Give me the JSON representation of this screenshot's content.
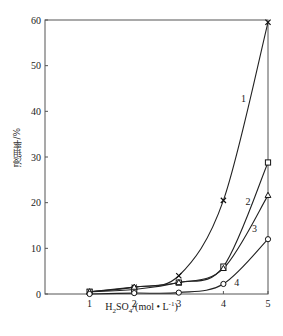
{
  "chart_data": {
    "type": "line",
    "title": "",
    "xlabel": "H2SO4/(mol·L⁻¹)",
    "ylabel": "浸钼率/%",
    "xlim": [
      0,
      5
    ],
    "ylim": [
      0,
      60
    ],
    "xticks": [
      1,
      2,
      3,
      4,
      5
    ],
    "yticks": [
      0,
      10,
      20,
      30,
      40,
      50,
      60
    ],
    "grid": false,
    "legend": "inline curve numbers",
    "x": [
      1,
      2,
      3,
      4,
      5
    ],
    "series": [
      {
        "name": "1",
        "marker": "x",
        "values": [
          0.5,
          1.5,
          4.0,
          20.5,
          59.5
        ]
      },
      {
        "name": "2",
        "marker": "square",
        "values": [
          0.5,
          1.0,
          2.5,
          6.0,
          28.8
        ]
      },
      {
        "name": "3",
        "marker": "triangle",
        "values": [
          0.5,
          1.5,
          2.5,
          5.6,
          21.6
        ]
      },
      {
        "name": "4",
        "marker": "circle",
        "values": [
          0.0,
          0.2,
          0.3,
          2.2,
          12.0
        ]
      }
    ],
    "annotations": [
      {
        "text": "1",
        "x": 4.45,
        "y": 42
      },
      {
        "text": "2",
        "x": 4.55,
        "y": 19.5
      },
      {
        "text": "3",
        "x": 4.7,
        "y": 13.5
      },
      {
        "text": "4",
        "x": 4.3,
        "y": 1.7
      }
    ]
  },
  "labels": {
    "ylabel": "浸钼率/%",
    "xlabel_main": "H",
    "xlabel_sub2": "2",
    "xlabel_so": "SO",
    "xlabel_sub4": "4",
    "xlabel_unit": "/(mol • L",
    "xlabel_exp": "-1",
    "xlabel_close": ")"
  }
}
